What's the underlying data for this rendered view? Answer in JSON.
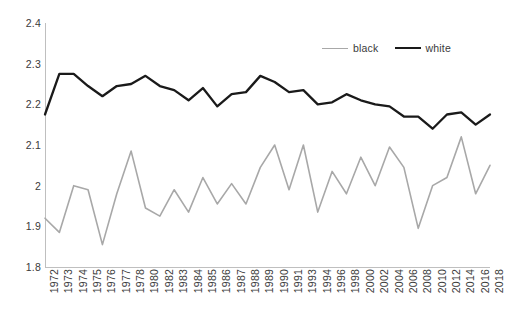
{
  "chart_data": {
    "type": "line",
    "title": "",
    "subtitle": "",
    "xlabel": "",
    "ylabel": "",
    "ylim": [
      1.8,
      2.4
    ],
    "yticks": [
      2.4,
      2.3,
      2.2,
      2.1,
      2,
      1.9,
      1.8
    ],
    "ytick_labels": [
      "2.4",
      "2.3",
      "2.2",
      "2.1",
      "2",
      "1.9",
      "1.8"
    ],
    "grid": false,
    "legend_position": "top-right",
    "categories": [
      "1972",
      "1973",
      "1974",
      "1975",
      "1976",
      "1977",
      "1978",
      "1980",
      "1982",
      "1983",
      "1984",
      "1985",
      "1986",
      "1987",
      "1988",
      "1989",
      "1990",
      "1991",
      "1993",
      "1994",
      "1996",
      "1998",
      "2000",
      "2002",
      "2004",
      "2006",
      "2008",
      "2010",
      "2012",
      "2014",
      "2016",
      "2018"
    ],
    "series": [
      {
        "name": "black",
        "color": "#a8a8a8",
        "values": [
          1.92,
          1.885,
          2.0,
          1.99,
          1.855,
          1.98,
          2.085,
          1.945,
          1.925,
          1.99,
          1.935,
          2.02,
          1.955,
          2.005,
          1.955,
          2.045,
          2.1,
          1.99,
          2.1,
          1.935,
          2.035,
          1.98,
          2.07,
          2.0,
          2.095,
          2.045,
          1.895,
          2.0,
          2.02,
          2.12,
          1.98,
          2.05
        ]
      },
      {
        "name": "white",
        "color": "#1a1a1a",
        "values": [
          2.175,
          2.275,
          2.275,
          2.245,
          2.22,
          2.245,
          2.25,
          2.27,
          2.245,
          2.235,
          2.21,
          2.24,
          2.195,
          2.225,
          2.23,
          2.27,
          2.255,
          2.23,
          2.235,
          2.2,
          2.205,
          2.225,
          2.21,
          2.2,
          2.195,
          2.17,
          2.17,
          2.14,
          2.175,
          2.18,
          2.15,
          2.175
        ]
      }
    ],
    "legend": [
      {
        "label": "black",
        "style": "thin"
      },
      {
        "label": "white",
        "style": "thick"
      }
    ]
  },
  "axes": {
    "plot_left": 45,
    "plot_right": 490,
    "plot_top": 23,
    "plot_bottom": 267
  }
}
